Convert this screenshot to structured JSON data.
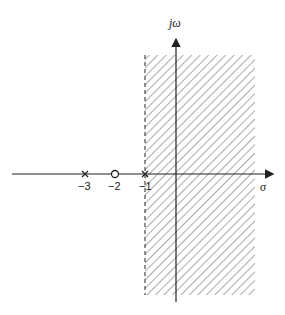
{
  "diagram": {
    "axes": {
      "vertical_label": "jω",
      "horizontal_label": "σ"
    },
    "ticks": [
      {
        "label": "−3",
        "value": -3
      },
      {
        "label": "−2",
        "value": -2
      },
      {
        "label": "−1",
        "value": -1
      }
    ],
    "poles": [
      {
        "value": -3,
        "marker": "x"
      },
      {
        "value": -1,
        "marker": "x"
      }
    ],
    "zeros": [
      {
        "value": -2,
        "marker": "o"
      }
    ],
    "shaded_region": {
      "description": "Re(s) > -1",
      "boundary": -1,
      "boundary_style": "dashed",
      "pattern": "diagonal-hatch"
    },
    "colors": {
      "lines": "#222222",
      "hatch": "#555555"
    }
  }
}
